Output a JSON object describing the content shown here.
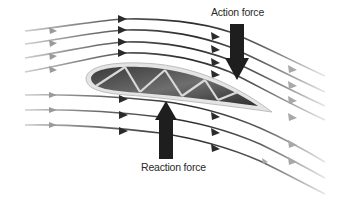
{
  "diagram": {
    "labels": {
      "action_force": "Action force",
      "reaction_force": "Reaction force"
    },
    "elements": {
      "airfoil": "airfoil-cross-section",
      "streamlines_above": 4,
      "streamlines_below": 3,
      "action_arrow_direction": "down",
      "reaction_arrow_direction": "up"
    },
    "colors": {
      "streamline_dark": "#2b2b2b",
      "streamline_fade": "#bdbdbd",
      "arrow_fill": "#1e1e1e",
      "airfoil_fill": "#4a4a4a",
      "airfoil_rim": "#d8d8d8"
    }
  }
}
